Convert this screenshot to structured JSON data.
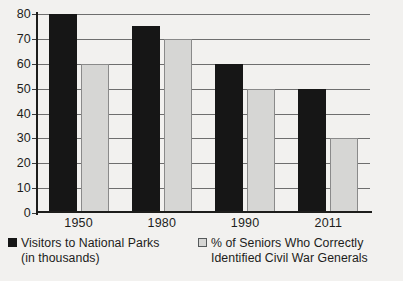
{
  "chart_data": {
    "type": "bar",
    "title": "",
    "subtitle": "",
    "xlabel": "",
    "ylabel": "",
    "categories": [
      "1950",
      "1980",
      "1990",
      "2011"
    ],
    "series": [
      {
        "name": "Visitors to National Parks (in thousands)",
        "legend_line_1": "Visitors to National Parks",
        "legend_line_2": "(in thousands)",
        "swatch": "dark",
        "color": "#161616",
        "values": [
          80,
          75,
          60,
          50
        ]
      },
      {
        "name": "% of Seniors Who Correctly Identified Civil War Generals",
        "legend_line_1": "% of Seniors Who Correctly",
        "legend_line_2": "Identified Civil War Generals",
        "swatch": "light",
        "color": "#d6d6d4",
        "values": [
          60,
          70,
          50,
          30
        ]
      }
    ],
    "ylim": [
      0,
      80
    ],
    "ytick_values": [
      80,
      70,
      60,
      50,
      40,
      30,
      20,
      10,
      0
    ],
    "ytick_labels": [
      "80",
      "70",
      "60",
      "50",
      "40",
      "30",
      "20",
      "10",
      "0"
    ],
    "grid": true,
    "grid_orientation": "horizontal",
    "legend_position": "bottom",
    "background_color": "#f2f1ef",
    "axis_color": "#1d1d1b",
    "grid_color": "#6e6e6e"
  }
}
